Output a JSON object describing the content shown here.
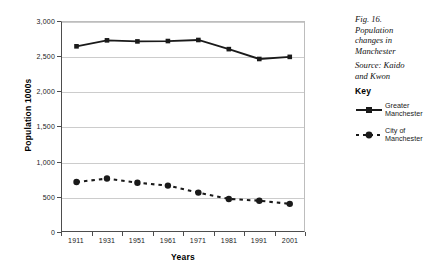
{
  "caption": {
    "line1": "Fig. 16.",
    "line2": "Population",
    "line3": "changes in",
    "line4": "Manchester",
    "line5": "Source: Kaido",
    "line6": "and Kwon"
  },
  "legend": {
    "title": "Key",
    "items": [
      {
        "label_line1": "Greater",
        "label_line2": "Manchester",
        "style": "solid",
        "marker": "square",
        "color": "#1a1a1a"
      },
      {
        "label_line1": "City of",
        "label_line2": "Manchester",
        "style": "dashed",
        "marker": "circle",
        "color": "#1a1a1a"
      }
    ]
  },
  "chart_data": {
    "type": "line",
    "title": "",
    "xlabel": "Years",
    "ylabel": "Population 1000s",
    "categories": [
      "1911",
      "1931",
      "1951",
      "1961",
      "1971",
      "1981",
      "1991",
      "2001"
    ],
    "ylim": [
      0,
      3000
    ],
    "yticks": [
      0,
      500,
      1000,
      1500,
      2000,
      2500,
      3000
    ],
    "ytick_labels": [
      "0",
      "500",
      "1,000",
      "1,500",
      "2,000",
      "2,500",
      "3,000"
    ],
    "grid": true,
    "legend_position": "right",
    "series": [
      {
        "name": "Greater Manchester",
        "style": "solid",
        "marker": "square",
        "color": "#1a1a1a",
        "values": [
          2640,
          2725,
          2710,
          2715,
          2730,
          2600,
          2460,
          2490
        ]
      },
      {
        "name": "City of Manchester",
        "style": "dashed",
        "marker": "circle",
        "color": "#1a1a1a",
        "values": [
          710,
          760,
          700,
          660,
          560,
          470,
          445,
          400
        ]
      }
    ]
  }
}
